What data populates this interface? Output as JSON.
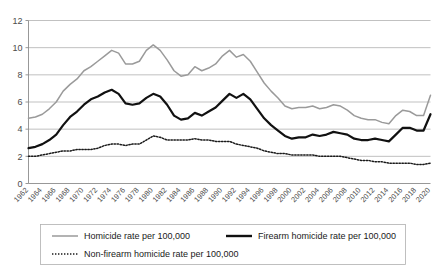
{
  "chart_data": {
    "type": "line",
    "title": "",
    "xlabel": "",
    "ylabel": "",
    "ylim": [
      0,
      12
    ],
    "ytick_values": [
      0,
      2,
      4,
      6,
      8,
      10,
      12
    ],
    "ytick_labels": [
      "0",
      "2",
      "4",
      "6",
      "8",
      "10",
      "12"
    ],
    "grid": true,
    "legend_position": "bottom-left",
    "xlim": [
      1962,
      2020
    ],
    "x": [
      1962,
      1963,
      1964,
      1965,
      1966,
      1967,
      1968,
      1969,
      1970,
      1971,
      1972,
      1973,
      1974,
      1975,
      1976,
      1977,
      1978,
      1979,
      1980,
      1981,
      1982,
      1983,
      1984,
      1985,
      1986,
      1987,
      1988,
      1989,
      1990,
      1991,
      1992,
      1993,
      1994,
      1995,
      1996,
      1997,
      1998,
      1999,
      2000,
      2001,
      2002,
      2003,
      2004,
      2005,
      2006,
      2007,
      2008,
      2009,
      2010,
      2011,
      2012,
      2013,
      2014,
      2015,
      2016,
      2017,
      2018,
      2019,
      2020
    ],
    "xtick_labels": [
      "1962",
      "1964",
      "1966",
      "1968",
      "1970",
      "1972",
      "1974",
      "1976",
      "1978",
      "1980",
      "1982",
      "1984",
      "1986",
      "1988",
      "1990",
      "1992",
      "1994",
      "1996",
      "1998",
      "2000",
      "2002",
      "2004",
      "2006",
      "2008",
      "2010",
      "2012",
      "2014",
      "2016",
      "2018",
      "2020"
    ],
    "series": [
      {
        "name": "Homicide rate per 100,000",
        "color": "#9a9a9a",
        "style": "solid",
        "values": [
          4.8,
          4.9,
          5.1,
          5.5,
          6.0,
          6.8,
          7.3,
          7.7,
          8.3,
          8.6,
          9.0,
          9.4,
          9.8,
          9.6,
          8.8,
          8.8,
          9.0,
          9.8,
          10.2,
          9.8,
          9.1,
          8.3,
          7.9,
          8.0,
          8.6,
          8.3,
          8.5,
          8.8,
          9.4,
          9.8,
          9.3,
          9.5,
          9.0,
          8.2,
          7.4,
          6.8,
          6.3,
          5.7,
          5.5,
          5.6,
          5.6,
          5.7,
          5.5,
          5.6,
          5.8,
          5.7,
          5.4,
          5.0,
          4.8,
          4.7,
          4.7,
          4.5,
          4.4,
          5.0,
          5.4,
          5.3,
          5.0,
          5.0,
          6.5
        ]
      },
      {
        "name": "Firearm homicide rate per 100,000",
        "color": "#111111",
        "style": "solid-thick",
        "values": [
          2.6,
          2.7,
          2.9,
          3.2,
          3.6,
          4.3,
          4.9,
          5.3,
          5.8,
          6.2,
          6.4,
          6.7,
          6.9,
          6.6,
          5.9,
          5.8,
          5.9,
          6.3,
          6.6,
          6.4,
          5.8,
          5.0,
          4.7,
          4.8,
          5.2,
          5.0,
          5.3,
          5.6,
          6.1,
          6.6,
          6.3,
          6.6,
          6.2,
          5.5,
          4.8,
          4.3,
          3.9,
          3.5,
          3.3,
          3.4,
          3.4,
          3.6,
          3.5,
          3.6,
          3.8,
          3.7,
          3.6,
          3.3,
          3.2,
          3.2,
          3.3,
          3.2,
          3.1,
          3.6,
          4.1,
          4.1,
          3.9,
          3.9,
          5.1
        ]
      },
      {
        "name": "Non-firearm homicide rate per 100,000",
        "color": "#1a1a1a",
        "style": "dotted",
        "values": [
          2.0,
          2.0,
          2.1,
          2.2,
          2.3,
          2.4,
          2.4,
          2.5,
          2.5,
          2.5,
          2.6,
          2.8,
          2.9,
          2.9,
          2.8,
          2.9,
          2.9,
          3.2,
          3.5,
          3.4,
          3.2,
          3.2,
          3.2,
          3.2,
          3.3,
          3.2,
          3.2,
          3.1,
          3.1,
          3.1,
          2.9,
          2.8,
          2.7,
          2.6,
          2.4,
          2.3,
          2.2,
          2.2,
          2.1,
          2.1,
          2.1,
          2.1,
          2.0,
          2.0,
          2.0,
          2.0,
          1.9,
          1.8,
          1.7,
          1.7,
          1.6,
          1.6,
          1.5,
          1.5,
          1.5,
          1.5,
          1.4,
          1.4,
          1.5
        ]
      }
    ]
  },
  "legend": {
    "items": [
      {
        "label": "Homicide rate per 100,000",
        "style": "solid"
      },
      {
        "label": "Firearm homicide rate per 100,000",
        "style": "solid-thick"
      },
      {
        "label": "Non-firearm homicide rate per 100,000",
        "style": "dotted"
      }
    ]
  }
}
